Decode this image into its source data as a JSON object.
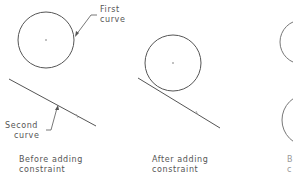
{
  "panels": [
    {
      "caption_line1": "Before adding",
      "caption_line2": "constraint",
      "callouts": [
        {
          "line1": "First",
          "line2": "curve"
        },
        {
          "line1": "Second",
          "line2": "curve"
        }
      ]
    },
    {
      "caption_line1": "After adding",
      "caption_line2": "constraint"
    },
    {
      "caption_line1": "B",
      "caption_line2": "c"
    }
  ],
  "colors": {
    "stroke": "#555555",
    "text": "#555555",
    "background": "#ffffff"
  }
}
